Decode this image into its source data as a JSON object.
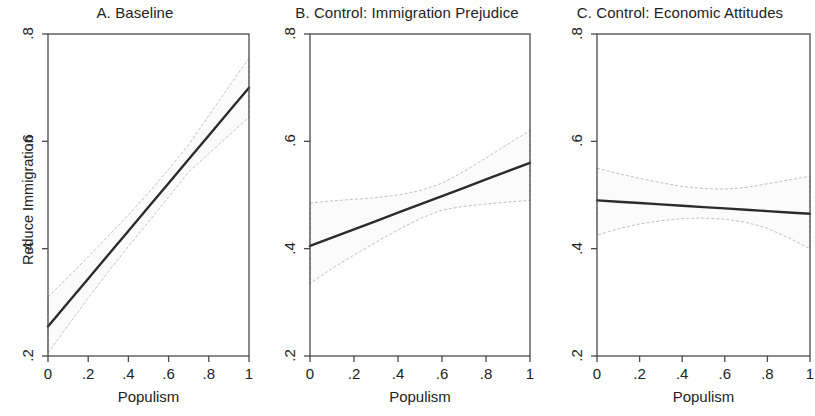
{
  "figure": {
    "y_axis_label": "Reduce Immigration",
    "x_axis_label": "Populism",
    "y_ticks": [
      ".2",
      ".4",
      ".6",
      ".8"
    ],
    "x_ticks": [
      "0",
      ".2",
      ".4",
      ".6",
      ".8",
      "1"
    ],
    "line_color": "#2b2b2b",
    "ci_color": "#b9b9b9",
    "axis_color": "#4a4a4a",
    "background": "#ffffff"
  },
  "panels": [
    {
      "title": "A. Baseline"
    },
    {
      "title": "B. Control: Immigration Prejudice"
    },
    {
      "title": "C. Control: Economic Attitudes"
    }
  ],
  "chart_data": {
    "type": "line",
    "title": "",
    "xlabel": "Populism",
    "ylabel": "Reduce Immigration",
    "xlim": [
      0,
      1
    ],
    "ylim": [
      0.2,
      0.8
    ],
    "xticks": [
      0,
      0.2,
      0.4,
      0.6,
      0.8,
      1
    ],
    "yticks": [
      0.2,
      0.4,
      0.6,
      0.8
    ],
    "grid": false,
    "legend": "none",
    "panels": [
      {
        "label": "A",
        "title": "A. Baseline",
        "x": [
          0,
          0.1,
          0.2,
          0.3,
          0.4,
          0.5,
          0.6,
          0.7,
          0.8,
          0.9,
          1
        ],
        "fit": [
          0.255,
          0.2995,
          0.344,
          0.3885,
          0.433,
          0.4775,
          0.522,
          0.5665,
          0.611,
          0.6555,
          0.7
        ],
        "ci_lower": [
          0.205,
          0.257,
          0.308,
          0.357,
          0.404,
          0.45,
          0.496,
          0.543,
          0.577,
          0.611,
          0.645
        ],
        "ci_upper": [
          0.31,
          0.347,
          0.385,
          0.424,
          0.463,
          0.504,
          0.548,
          0.594,
          0.648,
          0.702,
          0.755
        ]
      },
      {
        "label": "B",
        "title": "B. Control: Immigration Prejudice",
        "x": [
          0,
          0.1,
          0.2,
          0.3,
          0.4,
          0.5,
          0.6,
          0.7,
          0.8,
          0.9,
          1
        ],
        "fit": [
          0.405,
          0.4205,
          0.436,
          0.4515,
          0.467,
          0.4825,
          0.498,
          0.5135,
          0.529,
          0.5445,
          0.56
        ],
        "ci_lower": [
          0.335,
          0.363,
          0.388,
          0.412,
          0.435,
          0.456,
          0.472,
          0.479,
          0.483,
          0.487,
          0.49
        ],
        "ci_upper": [
          0.485,
          0.489,
          0.492,
          0.495,
          0.5,
          0.508,
          0.522,
          0.544,
          0.569,
          0.595,
          0.62
        ]
      },
      {
        "label": "C",
        "title": "C. Control: Economic Attitudes",
        "x": [
          0,
          0.1,
          0.2,
          0.3,
          0.4,
          0.5,
          0.6,
          0.7,
          0.8,
          0.9,
          1
        ],
        "fit": [
          0.49,
          0.4875,
          0.485,
          0.4825,
          0.48,
          0.4775,
          0.475,
          0.4725,
          0.47,
          0.4675,
          0.465
        ],
        "ci_lower": [
          0.425,
          0.437,
          0.446,
          0.452,
          0.456,
          0.457,
          0.455,
          0.449,
          0.438,
          0.42,
          0.4
        ],
        "ci_upper": [
          0.55,
          0.54,
          0.531,
          0.523,
          0.516,
          0.512,
          0.511,
          0.514,
          0.521,
          0.528,
          0.535
        ]
      }
    ]
  }
}
